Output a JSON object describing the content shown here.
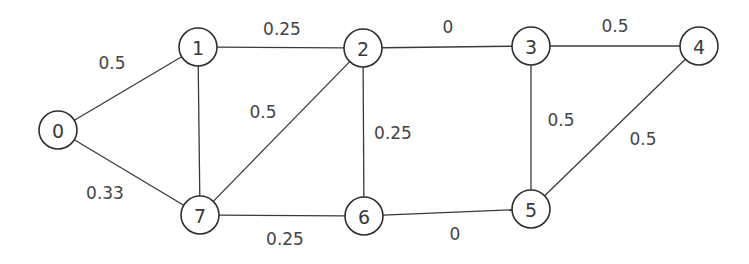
{
  "graph": {
    "node_radius": 19,
    "colors": {
      "stroke": "#2e2e2e",
      "edge": "#3a3a3a",
      "text": "#444444",
      "background": "#ffffff"
    },
    "nodes": [
      {
        "id": "0",
        "label": "0",
        "x": 58,
        "y": 130
      },
      {
        "id": "1",
        "label": "1",
        "x": 198,
        "y": 47
      },
      {
        "id": "2",
        "label": "2",
        "x": 363,
        "y": 48
      },
      {
        "id": "3",
        "label": "3",
        "x": 531,
        "y": 46
      },
      {
        "id": "4",
        "label": "4",
        "x": 699,
        "y": 46
      },
      {
        "id": "5",
        "label": "5",
        "x": 531,
        "y": 209
      },
      {
        "id": "6",
        "label": "6",
        "x": 364,
        "y": 216
      },
      {
        "id": "7",
        "label": "7",
        "x": 200,
        "y": 215
      }
    ],
    "edges": [
      {
        "from": "0",
        "to": "1",
        "weight": "0.5",
        "label_x": 112,
        "label_y": 63
      },
      {
        "from": "0",
        "to": "7",
        "weight": "0.33",
        "label_x": 105,
        "label_y": 193
      },
      {
        "from": "1",
        "to": "2",
        "weight": "0.25",
        "label_x": 282,
        "label_y": 29
      },
      {
        "from": "1",
        "to": "7",
        "weight": "",
        "label_x": 0,
        "label_y": 0
      },
      {
        "from": "7",
        "to": "2",
        "weight": "0.5",
        "label_x": 263,
        "label_y": 112
      },
      {
        "from": "2",
        "to": "6",
        "weight": "0.25",
        "label_x": 393,
        "label_y": 133
      },
      {
        "from": "2",
        "to": "3",
        "weight": "0",
        "label_x": 448,
        "label_y": 27
      },
      {
        "from": "3",
        "to": "4",
        "weight": "0.5",
        "label_x": 615,
        "label_y": 26
      },
      {
        "from": "3",
        "to": "5",
        "weight": "0.5",
        "label_x": 561,
        "label_y": 120
      },
      {
        "from": "4",
        "to": "5",
        "weight": "0.5",
        "label_x": 643,
        "label_y": 139
      },
      {
        "from": "7",
        "to": "6",
        "weight": "0.25",
        "label_x": 285,
        "label_y": 239
      },
      {
        "from": "6",
        "to": "5",
        "weight": "0",
        "label_x": 455,
        "label_y": 234
      }
    ]
  }
}
